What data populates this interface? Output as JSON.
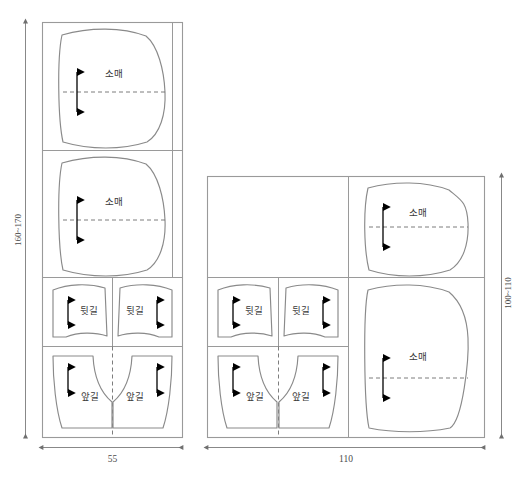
{
  "diagram": {
    "labels": {
      "sleeve": "소매",
      "back_body": "뒷길",
      "front_body": "앞길"
    },
    "layouts": [
      {
        "name": "narrow-fabric-layout",
        "width_label": "55",
        "height_label": "160~170",
        "pieces": [
          {
            "id": "sleeve-top",
            "label": "소매",
            "type": "sleeve"
          },
          {
            "id": "sleeve-second",
            "label": "소매",
            "type": "sleeve"
          },
          {
            "id": "back-left",
            "label": "뒷길",
            "type": "back"
          },
          {
            "id": "back-right",
            "label": "뒷길",
            "type": "back"
          },
          {
            "id": "front-left",
            "label": "앞길",
            "type": "front"
          },
          {
            "id": "front-right",
            "label": "앞길",
            "type": "front"
          }
        ]
      },
      {
        "name": "wide-fabric-layout",
        "width_label": "110",
        "height_label": "100~110",
        "pieces": [
          {
            "id": "sleeve-upper-right",
            "label": "소매",
            "type": "sleeve"
          },
          {
            "id": "sleeve-lower-right",
            "label": "소매",
            "type": "sleeve"
          },
          {
            "id": "back-left",
            "label": "뒷길",
            "type": "back"
          },
          {
            "id": "back-right",
            "label": "뒷길",
            "type": "back"
          },
          {
            "id": "front-left",
            "label": "앞길",
            "type": "front"
          },
          {
            "id": "front-right",
            "label": "앞길",
            "type": "front"
          }
        ]
      }
    ],
    "colors": {
      "frame_stroke": "#9a9a9a",
      "piece_stroke": "#8a8a8a",
      "grain_arrow": "#000000",
      "label_text": "#3a3a3a",
      "dimension_text": "#4a4a4a",
      "background": "#ffffff"
    }
  }
}
